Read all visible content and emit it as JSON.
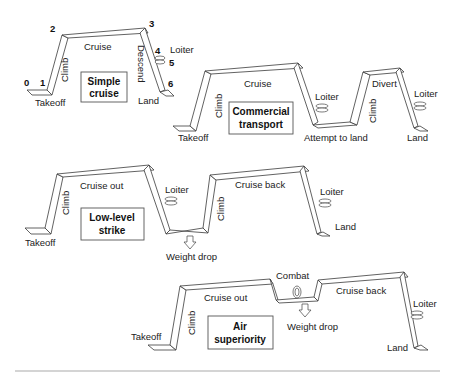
{
  "profiles": {
    "simple_cruise": {
      "title_line1": "Simple",
      "title_line2": "cruise",
      "points": [
        "0",
        "1",
        "2",
        "3",
        "4",
        "5",
        "6"
      ],
      "labels": {
        "takeoff": "Takeoff",
        "climb": "Climb",
        "cruise": "Cruise",
        "descend": "Descend",
        "loiter": "Loiter",
        "land": "Land"
      }
    },
    "commercial_transport": {
      "title_line1": "Commercial",
      "title_line2": "transport",
      "labels": {
        "takeoff": "Takeoff",
        "climb": "Climb",
        "cruise": "Cruise",
        "loiter1": "Loiter",
        "attempt": "Attempt to land",
        "climb2": "Climb",
        "divert": "Divert",
        "loiter2": "Loiter",
        "land": "Land"
      }
    },
    "low_level_strike": {
      "title_line1": "Low-level",
      "title_line2": "strike",
      "labels": {
        "takeoff": "Takeoff",
        "climb": "Climb",
        "cruise_out": "Cruise out",
        "loiter1": "Loiter",
        "weight_drop": "Weight drop",
        "climb2": "Climb",
        "cruise_back": "Cruise back",
        "loiter2": "Loiter",
        "land": "Land"
      }
    },
    "air_superiority": {
      "title_line1": "Air",
      "title_line2": "superiority",
      "labels": {
        "takeoff": "Takeoff",
        "climb": "Climb",
        "cruise_out": "Cruise out",
        "combat": "Combat",
        "weight_drop": "Weight drop",
        "cruise_back": "Cruise back",
        "loiter": "Loiter",
        "land": "Land"
      }
    }
  },
  "colors": {
    "line": "#3a3a3a",
    "box_border": "#555555",
    "rule": "#aaaaaa"
  }
}
